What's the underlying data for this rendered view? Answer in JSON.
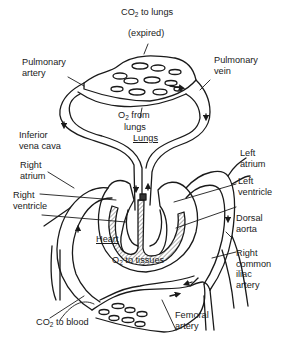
{
  "diagram": {
    "colors": {
      "ink": "#1a1a1a",
      "background": "#ffffff",
      "hatch": "#9a9a9a"
    },
    "labels": {
      "co2_lungs_line1_a": "CO",
      "co2_lungs_line1_sub": "2",
      "co2_lungs_line1_b": " to lungs",
      "co2_lungs_line2": "(expired)",
      "pulmonary_artery": "Pulmonary\nartery",
      "pulmonary_vein": "Pulmonary\nvein",
      "o2_from_lungs_a": "O",
      "o2_from_lungs_sub": "2",
      "o2_from_lungs_b": " from",
      "o2_from_lungs_line2": "lungs",
      "lungs": "Lungs",
      "inferior_vena_cava": "Inferior\nvena cava",
      "right_atrium": "Right\natrium",
      "right_ventricle": "Right\nventricle",
      "left_atrium": "Left\natrium",
      "left_ventricle": "Left\nventricle",
      "dorsal_aorta": "Dorsal\naorta",
      "heart": "Heart",
      "o2_to_tissues_a": "O",
      "o2_to_tissues_sub": "2",
      "o2_to_tissues_b": " to tissues",
      "right_common_iliac_artery": "Right\ncommon\niliac\nartery",
      "co2_to_blood_a": "CO",
      "co2_to_blood_sub": "2",
      "co2_to_blood_b": " to blood",
      "femoral_artery": "Femoral\nartery"
    }
  }
}
